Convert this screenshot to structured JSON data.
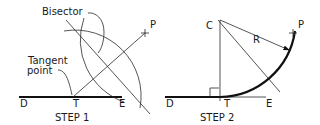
{
  "step1": {
    "caption": "STEP 1",
    "labels": {
      "bisector": "Bisector",
      "tangent_line1": "Tangent",
      "tangent_line2": "point",
      "P": "P",
      "D": "D",
      "T": "T",
      "E": "E"
    }
  },
  "step2": {
    "caption": "STEP 2",
    "labels": {
      "C": "C",
      "R": "R",
      "P": "P",
      "D": "D",
      "T": "T",
      "E": "E"
    }
  },
  "colors": {
    "line": "#111111",
    "background": "#ffffff"
  }
}
